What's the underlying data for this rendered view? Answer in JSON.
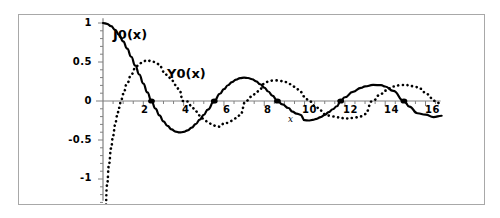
{
  "figure": {
    "frame_color": "#a8a8a8",
    "background": "#ffffff",
    "xaxis_name": "x"
  },
  "labels": {
    "j0": "J0(x)",
    "y0": "Y0(x)"
  },
  "chart_data": {
    "type": "line",
    "title": "",
    "subtitle": "",
    "xlabel": "x",
    "ylabel": "",
    "xlim": [
      0,
      16.8
    ],
    "ylim": [
      -1.25,
      1.05
    ],
    "xticks": [
      2,
      4,
      6,
      8,
      10,
      12,
      14,
      16
    ],
    "xticklabels": [
      "2",
      "4",
      "6",
      "8",
      "10",
      "12",
      "14",
      "16"
    ],
    "yticks": [
      1,
      0.5,
      0,
      -0.5,
      -1
    ],
    "yticklabels": [
      "1",
      "0.5",
      "0",
      "-0.5",
      "-1"
    ],
    "minor_tick_step_y": 0.1,
    "minor_tick_step_x": 0.5,
    "grid": false,
    "legend": "inline-annotations",
    "axis_color": "#808080",
    "series": [
      {
        "name": "J0(x)",
        "style": "solid",
        "color": "#000000",
        "linewidth": 2.2,
        "annotation": "J0(x)",
        "zeros": [
          2.405,
          5.52,
          8.654,
          11.792,
          14.931
        ],
        "x": [
          0,
          0.2,
          0.4,
          0.6,
          0.8,
          1,
          1.2,
          1.4,
          1.6,
          1.8,
          2,
          2.2,
          2.405,
          2.6,
          2.8,
          3,
          3.2,
          3.4,
          3.6,
          3.8,
          4,
          4.2,
          4.4,
          4.6,
          4.8,
          5,
          5.2,
          5.52,
          5.8,
          6,
          6.2,
          6.4,
          6.6,
          6.8,
          7,
          7.2,
          7.4,
          7.6,
          7.8,
          8,
          8.2,
          8.4,
          8.654,
          8.9,
          9.2,
          9.4,
          9.6,
          9.8,
          10,
          10.2,
          10.4,
          10.6,
          10.8,
          11,
          11.2,
          11.4,
          11.6,
          11.792,
          12,
          12.4,
          12.8,
          13,
          13.4,
          13.8,
          14,
          14.4,
          14.931,
          15.2,
          15.6,
          16,
          16.4,
          16.8
        ],
        "y": [
          1,
          0.99,
          0.96,
          0.912,
          0.846,
          0.765,
          0.671,
          0.567,
          0.455,
          0.34,
          0.224,
          0.11,
          0,
          -0.097,
          -0.185,
          -0.26,
          -0.32,
          -0.364,
          -0.392,
          -0.403,
          -0.397,
          -0.376,
          -0.342,
          -0.296,
          -0.24,
          -0.178,
          -0.11,
          0,
          0.093,
          0.151,
          0.202,
          0.243,
          0.274,
          0.293,
          0.3,
          0.295,
          0.279,
          0.251,
          0.215,
          0.172,
          0.122,
          0.069,
          0,
          -0.044,
          -0.09,
          -0.137,
          -0.161,
          -0.177,
          -0.246,
          -0.25,
          -0.243,
          -0.228,
          -0.206,
          -0.177,
          -0.143,
          -0.106,
          -0.067,
          0,
          0.048,
          0.117,
          0.169,
          0.187,
          0.206,
          0.203,
          0.186,
          0.13,
          0,
          -0.072,
          -0.157,
          -0.175,
          -0.206,
          -0.189
        ]
      },
      {
        "name": "Y0(x)",
        "style": "dotted",
        "color": "#000000",
        "linewidth": 2.6,
        "annotation": "Y0(x)",
        "zeros": [
          0.894,
          3.958,
          7.086,
          10.222,
          13.361,
          16.501
        ],
        "x": [
          0.12,
          0.2,
          0.3,
          0.4,
          0.5,
          0.6,
          0.7,
          0.8,
          0.894,
          1,
          1.2,
          1.4,
          1.6,
          1.8,
          2,
          2.2,
          2.4,
          2.6,
          2.8,
          3,
          3.2,
          3.4,
          3.6,
          3.8,
          3.958,
          4.2,
          4.4,
          4.6,
          4.8,
          5,
          5.2,
          5.4,
          5.6,
          5.8,
          6,
          6.2,
          6.4,
          6.6,
          6.8,
          7.086,
          7.4,
          7.6,
          7.8,
          8,
          8.2,
          8.4,
          8.6,
          8.8,
          9,
          9.2,
          9.4,
          9.6,
          9.8,
          10,
          10.222,
          10.6,
          10.8,
          11,
          11.2,
          11.4,
          11.6,
          11.8,
          12,
          12.4,
          12.8,
          13,
          13.361,
          13.8,
          14,
          14.4,
          14.8,
          15,
          15.4,
          15.8,
          16,
          16.501,
          16.8
        ],
        "y": [
          -1.45,
          -1.08,
          -0.807,
          -0.606,
          -0.445,
          -0.309,
          -0.191,
          -0.087,
          0,
          0.088,
          0.228,
          0.338,
          0.42,
          0.477,
          0.51,
          0.522,
          0.51,
          0.498,
          0.467,
          0.377,
          0.33,
          0.27,
          0.205,
          0.137,
          0,
          -0.007,
          -0.072,
          -0.132,
          -0.185,
          -0.231,
          -0.269,
          -0.298,
          -0.319,
          -0.33,
          -0.288,
          -0.281,
          -0.254,
          -0.221,
          -0.182,
          0,
          0.06,
          0.109,
          0.154,
          0.224,
          0.248,
          0.261,
          0.264,
          0.256,
          0.249,
          0.226,
          0.195,
          0.158,
          0.117,
          0.056,
          0,
          -0.083,
          -0.122,
          -0.168,
          -0.187,
          -0.199,
          -0.209,
          -0.215,
          -0.225,
          -0.217,
          -0.197,
          -0.168,
          0,
          0.092,
          0.133,
          0.186,
          0.206,
          0.205,
          0.19,
          0.156,
          0.095,
          0,
          -0.055
        ]
      }
    ]
  }
}
